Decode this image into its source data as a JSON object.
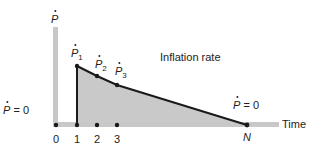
{
  "diagram": {
    "y_axis_label": "P",
    "x_axis_label": "Time",
    "curve_label": "Inflation rate",
    "left_equation": {
      "symbol": "P",
      "rest": "= 0"
    },
    "right_equation": {
      "symbol": "P",
      "rest": "= 0"
    },
    "end_point_label": "N",
    "points": [
      {
        "symbol": "P",
        "sub": "1"
      },
      {
        "symbol": "P",
        "sub": "2"
      },
      {
        "symbol": "P",
        "sub": "3"
      }
    ],
    "x_ticks": [
      "0",
      "1",
      "2",
      "3"
    ],
    "colors": {
      "axis": "#c8c8c8",
      "fill": "#c9c9c9",
      "line": "#1a1a1a",
      "text": "#222222"
    }
  }
}
